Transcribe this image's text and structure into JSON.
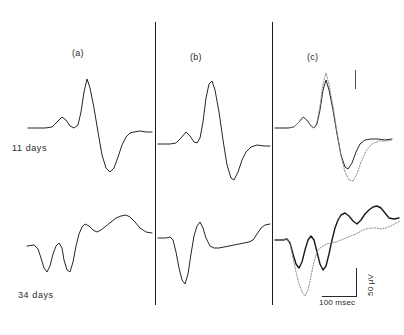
{
  "figure": {
    "type": "electrophysiology-waveform-figure",
    "panels": [
      {
        "id": "a",
        "label": "(a)"
      },
      {
        "id": "b",
        "label": "(b)"
      },
      {
        "id": "c",
        "label": "(c)"
      }
    ],
    "rows": [
      {
        "id": "row-11-days",
        "label": "11 days"
      },
      {
        "id": "row-34-days",
        "label": "34 days"
      }
    ],
    "calibration": {
      "amplitude_label": "50 µV",
      "time_label": "100 msec"
    }
  },
  "chart_data": {
    "type": "line",
    "title": "",
    "xlabel": "100 msec",
    "ylabel": "50 µV",
    "grid": false,
    "legend": "none",
    "panels": [
      {
        "panel": "(a)",
        "row": "11 days",
        "series": [
          {
            "name": "trace-a-11days",
            "style": "solid",
            "points": "28,128 45,128 52,127 57,122 62,117 66,120 70,126 74,128 78,125 81,112 84,92 87,79 90,88 94,108 98,132 102,155 106,168 110,172 114,168 118,157 122,145 126,137 130,133 134,132 140,131 146,132 152,132"
          }
        ]
      },
      {
        "panel": "(b)",
        "row": "11 days",
        "series": [
          {
            "name": "trace-b-11days",
            "style": "solid",
            "points": "158,144 170,144 176,143 181,138 186,132 190,136 194,142 197,143 200,138 203,122 206,98 209,84 212,81 215,90 219,112 223,140 227,165 231,178 234,180 238,172 242,160 246,152 251,147 257,145 264,146 270,146"
          }
        ]
      },
      {
        "panel": "(c)",
        "row": "11 days",
        "series": [
          {
            "name": "trace-c-11days-solid",
            "style": "solid",
            "points": "275,128 288,128 294,127 299,122 303,117 307,120 311,126 314,128 317,124 320,110 323,90 326,80 329,90 333,110 337,134 341,155 345,167 348,169 352,163 356,152 360,144 365,140 371,139 378,139 385,140 392,139"
          },
          {
            "name": "trace-c-11days-dotted",
            "style": "dotted",
            "points": "275,128 288,128 294,127 299,122 303,117 307,120 311,126 314,128 317,122 320,106 323,84 326,73 329,84 333,106 337,132 341,156 345,172 349,180 353,181 357,174 361,162 366,151 372,144 379,141 386,141 392,140"
          }
        ]
      },
      {
        "panel": "(a)",
        "row": "34 days",
        "series": [
          {
            "name": "trace-a-34days",
            "style": "solid",
            "points": "27,246 34,245 38,249 41,258 44,268 47,272 50,266 53,254 56,246 59,243 62,248 64,260 67,270 70,272 73,262 76,246 79,234 82,227 85,224 89,226 93,230 97,232 101,230 106,226 111,222 116,218 121,216 126,215 130,217 135,222 140,228 146,232 152,233"
          }
        ]
      },
      {
        "panel": "(b)",
        "row": "34 days",
        "series": [
          {
            "name": "trace-b-34days",
            "style": "solid",
            "points": "158,238 166,238 170,237 173,240 176,252 179,268 182,280 185,284 188,274 191,254 194,236 197,226 200,222 203,228 206,238 210,246 214,248 219,248 224,247 229,246 234,245 239,244 244,243 249,242 253,240 257,234 261,228 265,225 270,224"
          }
        ]
      },
      {
        "panel": "(c)",
        "row": "34 days",
        "series": [
          {
            "name": "trace-c-34days-solid",
            "style": "bold",
            "points": "275,240 283,240 287,239 290,243 293,254 296,264 299,268 302,262 305,250 308,240 311,236 314,240 317,252 320,264 323,270 326,266 329,254 332,240 335,228 338,220 341,215 345,213 349,216 353,221 357,224 361,220 365,214 369,210 373,207 377,206 381,208 385,213 389,218 394,219 399,218"
          },
          {
            "name": "trace-c-34days-dotted",
            "style": "dotted",
            "points": "275,240 283,240 287,239 290,244 293,258 296,272 299,284 302,292 305,296 308,290 311,276 314,262 317,252 320,248 323,246 327,244 331,243 336,242 341,240 346,238 351,236 356,234 361,231 366,229 371,228 376,228 381,229 386,228 391,226 396,223 400,221"
          }
        ]
      }
    ]
  }
}
